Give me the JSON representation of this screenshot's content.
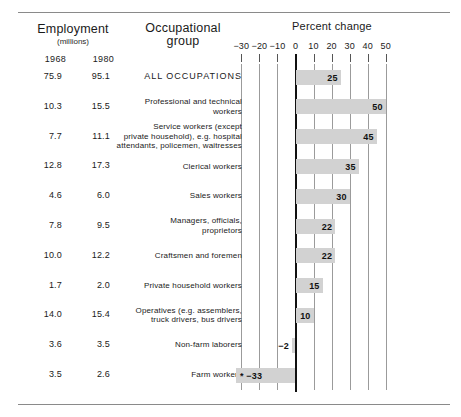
{
  "header": {
    "employment_title": "Employment",
    "employment_subtitle": "(millions)",
    "occupational_title": "Occupational\ngroup",
    "percent_change_title": "Percent change",
    "year_1": "1968",
    "year_2": "1980"
  },
  "chart_data": {
    "type": "bar",
    "orientation": "horizontal",
    "title": "Percent change",
    "xlabel": "Percent change",
    "ylabel": "Occupational group",
    "xlim": [
      -30,
      50
    ],
    "xticks": [
      -30,
      -20,
      -10,
      0,
      10,
      20,
      30,
      40,
      50
    ],
    "xtick_labels": [
      "−30",
      "−20",
      "−10",
      "0",
      "10",
      "20",
      "30",
      "40",
      "50"
    ],
    "grid": true,
    "legend": null,
    "bar_color": "#d2d2d2",
    "categories": [
      "ALL OCCUPATIONS",
      "Professional and technical workers",
      "Service workers (except private household), e.g. hospital attendants, policemen, waitresses",
      "Clerical workers",
      "Sales workers",
      "Managers, officials, proprietors",
      "Craftsmen and foremen",
      "Private household workers",
      "Operatives (e.g. assemblers, truck drivers, bus drivers",
      "Non-farm laborers",
      "Farm workers"
    ],
    "values": [
      25,
      50,
      45,
      35,
      30,
      22,
      22,
      15,
      10,
      -2,
      -33
    ],
    "value_labels": [
      "25",
      "50",
      "45",
      "35",
      "30",
      "22",
      "22",
      "15",
      "10",
      "−2",
      "−33"
    ],
    "employment_1968": [
      "75.9",
      "10.3",
      "7.7",
      "12.8",
      "4.6",
      "7.8",
      "10.0",
      "1.7",
      "14.0",
      "3.6",
      "3.5"
    ],
    "employment_1980": [
      "95.1",
      "15.5",
      "11.1",
      "17.3",
      "6.0",
      "9.5",
      "12.2",
      "2.0",
      "15.4",
      "3.5",
      "2.6"
    ]
  },
  "rows": [
    {
      "emp68": "75.9",
      "emp80": "95.1",
      "label_lines": [
        "ALL OCCUPATIONS"
      ],
      "value": "25",
      "caps": true
    },
    {
      "emp68": "10.3",
      "emp80": "15.5",
      "label_lines": [
        "Professional and technical",
        "workers"
      ],
      "value": "50",
      "caps": false
    },
    {
      "emp68": "7.7",
      "emp80": "11.1",
      "label_lines": [
        "Service workers (except",
        "private household), e.g. hospital",
        "attendants, policemen, waitresses"
      ],
      "value": "45",
      "caps": false
    },
    {
      "emp68": "12.8",
      "emp80": "17.3",
      "label_lines": [
        "Clerical workers"
      ],
      "value": "35",
      "caps": false
    },
    {
      "emp68": "4.6",
      "emp80": "6.0",
      "label_lines": [
        "Sales workers"
      ],
      "value": "30",
      "caps": false
    },
    {
      "emp68": "7.8",
      "emp80": "9.5",
      "label_lines": [
        "Managers, officials,",
        "proprietors"
      ],
      "value": "22",
      "caps": false
    },
    {
      "emp68": "10.0",
      "emp80": "12.2",
      "label_lines": [
        "Craftsmen and foremen"
      ],
      "value": "22",
      "caps": false
    },
    {
      "emp68": "1.7",
      "emp80": "2.0",
      "label_lines": [
        "Private household workers"
      ],
      "value": "15",
      "caps": false
    },
    {
      "emp68": "14.0",
      "emp80": "15.4",
      "label_lines": [
        "Operatives (e.g. assemblers,",
        "truck drivers, bus drivers"
      ],
      "value": "10",
      "caps": false
    },
    {
      "emp68": "3.6",
      "emp80": "3.5",
      "label_lines": [
        "Non-farm laborers"
      ],
      "value": "−2",
      "caps": false
    },
    {
      "emp68": "3.5",
      "emp80": "2.6",
      "label_lines": [
        "Farm workers"
      ],
      "value": "−33",
      "caps": false,
      "star": "*"
    }
  ]
}
